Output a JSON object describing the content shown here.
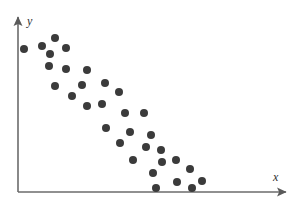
{
  "figure": {
    "name": "scatter-plot",
    "background_color": "#ffffff"
  },
  "axes": {
    "x_label": "x",
    "y_label": "y",
    "axis_color": "#6b6b6b",
    "origin": {
      "x": 18,
      "y": 192
    },
    "x_axis_end": {
      "x": 291,
      "y": 192
    },
    "y_axis_end": {
      "x": 18,
      "y": 13
    },
    "arrowheads": true,
    "ticks": false,
    "tick_labels": []
  },
  "chart_data": {
    "type": "scatter",
    "title": "",
    "subtitle": "",
    "xlabel": "x",
    "ylabel": "y",
    "grid": false,
    "legend": null,
    "legend_position": "none",
    "marker": {
      "shape": "circle",
      "color": "#3b3b3b",
      "diameter_px": 8
    },
    "axis_ranges": {
      "x_pixel": [
        18,
        291
      ],
      "y_pixel": [
        192,
        13
      ]
    },
    "note": "Strong negative linear association; points given in pixel coordinates of the plotting area.",
    "points_px": [
      [
        24,
        49
      ],
      [
        42,
        46
      ],
      [
        55,
        38
      ],
      [
        66,
        48
      ],
      [
        50,
        54
      ],
      [
        49,
        66
      ],
      [
        66,
        69
      ],
      [
        87,
        70
      ],
      [
        55,
        86
      ],
      [
        82,
        85
      ],
      [
        105,
        83
      ],
      [
        72,
        96
      ],
      [
        119,
        92
      ],
      [
        87,
        106
      ],
      [
        102,
        104
      ],
      [
        125,
        113
      ],
      [
        144,
        113
      ],
      [
        106,
        128
      ],
      [
        130,
        132
      ],
      [
        151,
        135
      ],
      [
        120,
        143
      ],
      [
        146,
        147
      ],
      [
        161,
        150
      ],
      [
        133,
        160
      ],
      [
        162,
        162
      ],
      [
        176,
        160
      ],
      [
        153,
        173
      ],
      [
        190,
        169
      ],
      [
        177,
        182
      ],
      [
        156,
        188
      ],
      [
        192,
        188
      ],
      [
        202,
        181
      ]
    ],
    "n_points": 32
  }
}
